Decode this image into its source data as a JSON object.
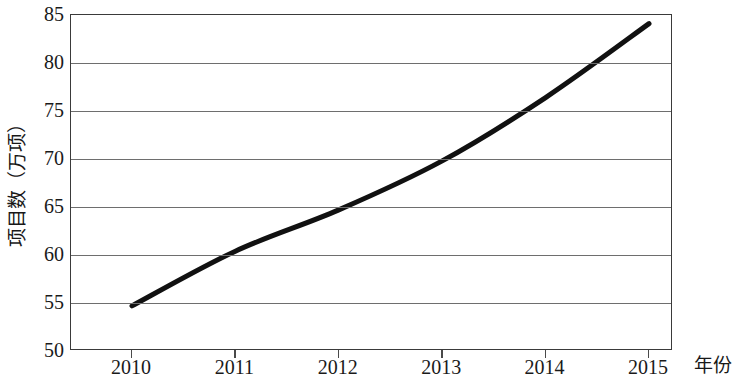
{
  "chart_data": {
    "type": "line",
    "title": "",
    "subtitle": "",
    "xlabel": "年份",
    "ylabel": "项目数（万项）",
    "categories": [
      "2010",
      "2011",
      "2012",
      "2013",
      "2014",
      "2015"
    ],
    "x": [
      2010,
      2011,
      2012,
      2013,
      2014,
      2015
    ],
    "values": [
      54.7,
      60.4,
      64.7,
      69.8,
      76.4,
      84.1
    ],
    "series": [
      {
        "name": "项目数",
        "values": [
          54.7,
          60.4,
          64.7,
          69.8,
          76.4,
          84.1
        ]
      }
    ],
    "ylim": [
      50,
      85
    ],
    "yticks": [
      50,
      55,
      60,
      65,
      70,
      75,
      80,
      85
    ],
    "ytick_labels": [
      "50",
      "55",
      "60",
      "65",
      "70",
      "75",
      "80",
      "85"
    ],
    "xtick_labels": [
      "2010",
      "2011",
      "2012",
      "2013",
      "2014",
      "2015"
    ],
    "grid": "horizontal",
    "legend": "none",
    "line_color": "#111111",
    "line_width": 5,
    "markers": "none",
    "frame_color": "#3a3a3a",
    "gridline_color": "#6e6e6e",
    "background": "#ffffff"
  }
}
